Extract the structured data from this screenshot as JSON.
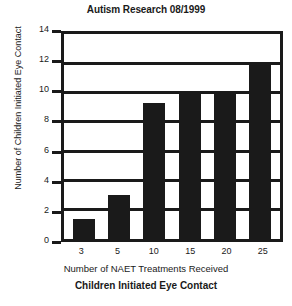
{
  "chart_data": {
    "type": "bar",
    "title": "Autism Research 08/1999",
    "caption": "Children Initiated Eye Contact",
    "xlabel": "Number of NAET Treatments Received",
    "ylabel": "Number of Children Initiated Eye Contact",
    "categories": [
      "3",
      "5",
      "10",
      "15",
      "20",
      "25"
    ],
    "values": [
      1.4,
      3,
      9.3,
      10,
      10,
      12
    ],
    "ylim": [
      0,
      14
    ],
    "yticks": [
      0,
      2,
      4,
      6,
      8,
      10,
      12,
      14
    ],
    "ytick_labels": [
      "0",
      "2",
      "4",
      "6",
      "8",
      "10",
      "12",
      "14"
    ],
    "grid": true,
    "grid_axis": "y",
    "legend": false,
    "bar_color": "#1a1a1a",
    "background_color": "#ffffff"
  }
}
